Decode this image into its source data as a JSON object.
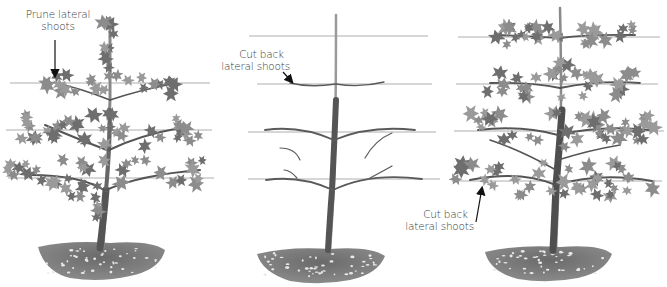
{
  "colors": {
    "background": "#ffffff",
    "wire": "#9a9a9a",
    "trunk": "#7a7a7a",
    "trunk_dark": "#4a4a4a",
    "leaf": "#8c8c8c",
    "leaf_dark": "#6e6e6e",
    "soil": "#5e5e5e",
    "stone": "#e8e8e8",
    "label_text": "#3a3a3a",
    "arrow": "#111111"
  },
  "panels": [
    {
      "id": "panel-1",
      "stage": "leafy tree before pruning",
      "annotation": {
        "line1": "Prune lateral",
        "line2": "shoots"
      }
    },
    {
      "id": "panel-2",
      "stage": "bare framework after cutting back",
      "annotation": {
        "line1": "Cut back",
        "line2": "lateral shoots"
      }
    },
    {
      "id": "panel-3",
      "stage": "mature leafy tree on wires",
      "annotation": {
        "line1": "Cut back",
        "line2": "lateral shoots"
      }
    }
  ]
}
